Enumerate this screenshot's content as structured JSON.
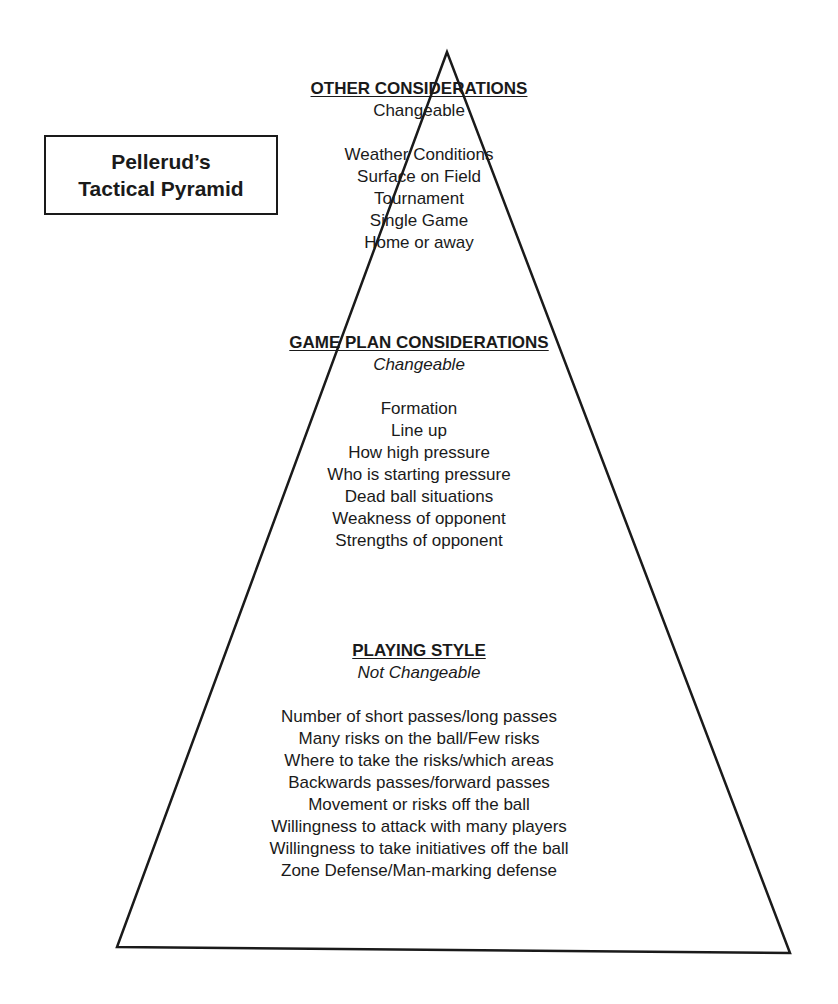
{
  "title": {
    "line1": "Pellerud’s",
    "line2": "Tactical Pyramid"
  },
  "sections": [
    {
      "heading": "OTHER CONSIDERATIONS",
      "subtitle": "Changeable",
      "subtitle_italic": false,
      "items": [
        "Weather Conditions",
        "Surface on Field",
        "Tournament",
        "Single Game",
        "Home or away"
      ]
    },
    {
      "heading": "GAME PLAN CONSIDERATIONS",
      "subtitle": "Changeable",
      "subtitle_italic": true,
      "items": [
        "Formation",
        "Line up",
        "How high pressure",
        "Who is starting pressure",
        "Dead ball situations",
        "Weakness of opponent",
        "Strengths of opponent"
      ]
    },
    {
      "heading": "PLAYING STYLE",
      "subtitle": "Not Changeable",
      "subtitle_italic": true,
      "items": [
        "Number of short passes/long passes",
        "Many risks on the ball/Few risks",
        "Where to take the risks/which areas",
        "Backwards passes/forward passes",
        "Movement or risks off the ball",
        "Willingness to attack with many players",
        "Willingness to take initiatives off the ball",
        "Zone Defense/Man-marking defense"
      ]
    }
  ],
  "colors": {
    "ink": "#1a1a1a",
    "background": "#ffffff"
  }
}
